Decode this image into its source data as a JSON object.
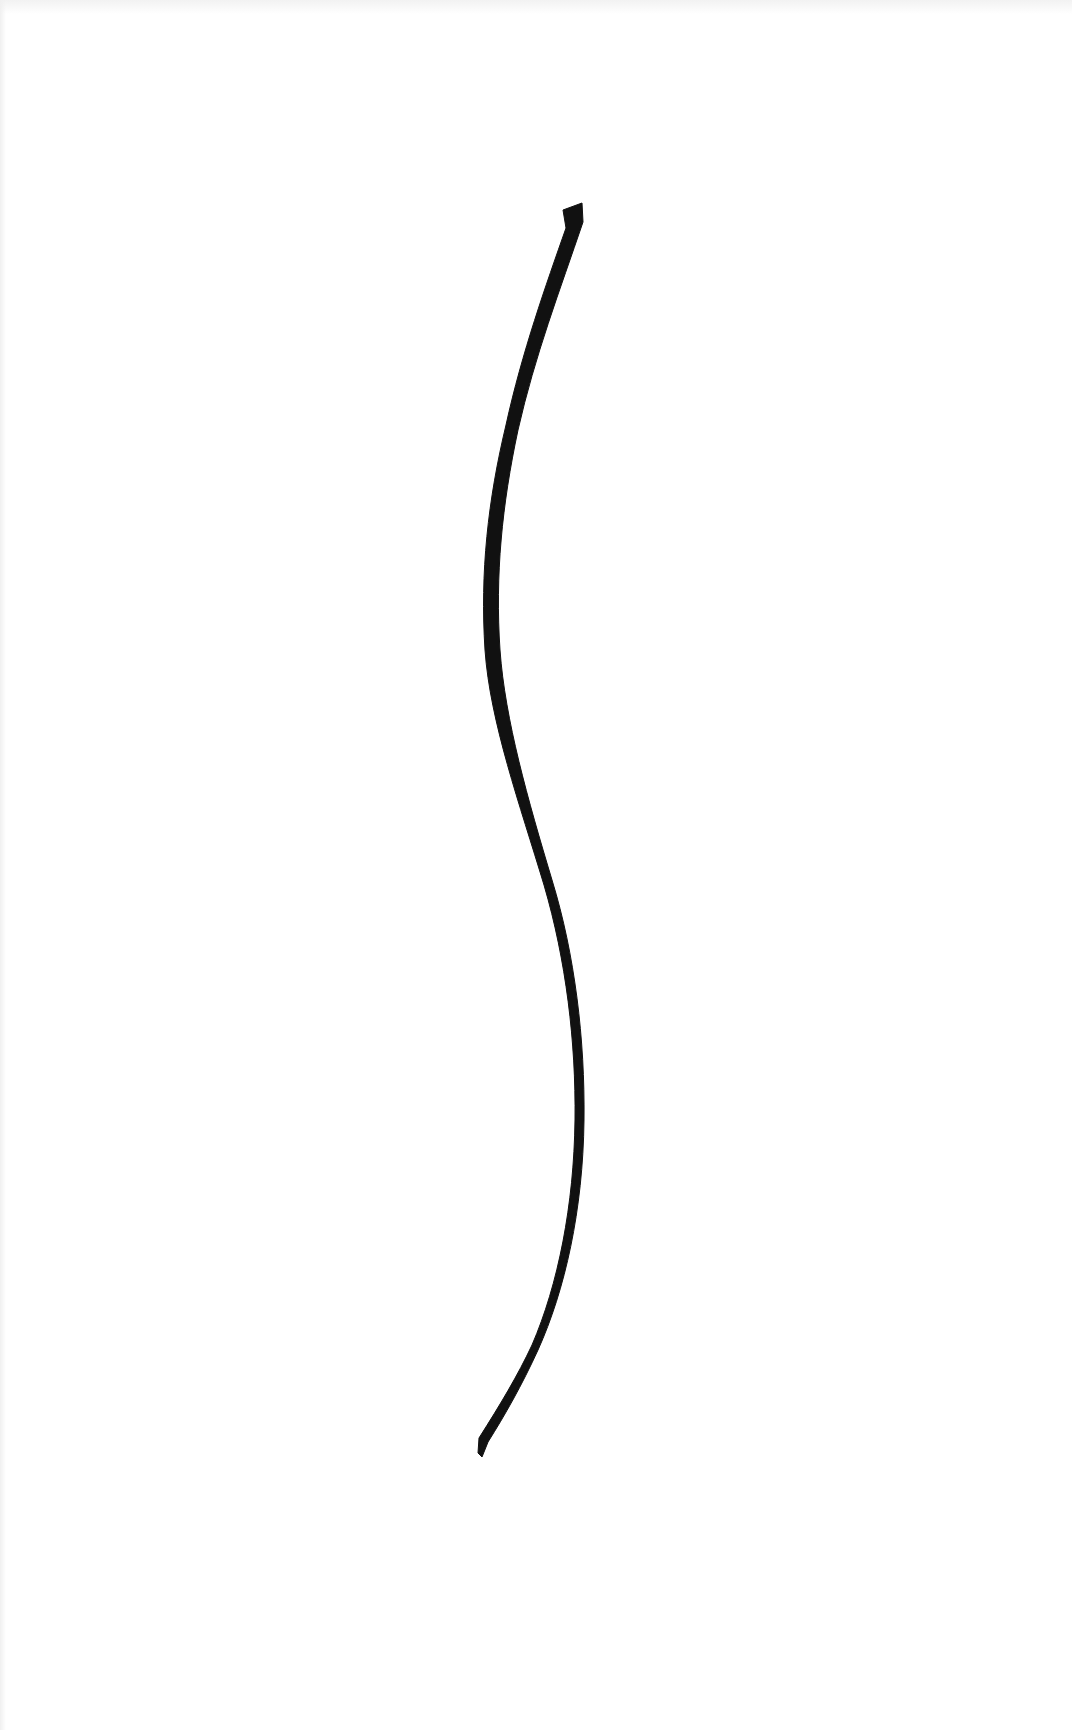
{
  "artwork": {
    "background_color": "#ffffff",
    "stroke_color": "#111111",
    "description": "Single black curved brushstroke on white"
  }
}
